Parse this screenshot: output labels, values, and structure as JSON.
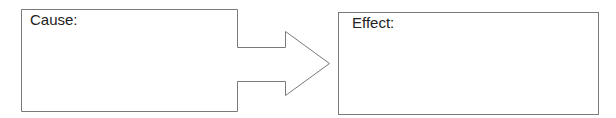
{
  "diagram": {
    "cause": {
      "label": "Cause:"
    },
    "effect": {
      "label": "Effect:"
    },
    "arrow": {
      "direction": "right"
    },
    "colors": {
      "stroke": "#7a7a7a",
      "text": "#222222",
      "background": "#ffffff"
    }
  }
}
